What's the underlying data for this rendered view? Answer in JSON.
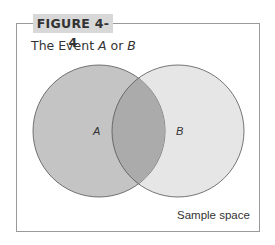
{
  "figure": {
    "label": "FIGURE 4-4",
    "title_prefix": "The Event ",
    "title_a": "A",
    "title_mid": " or ",
    "title_b": "B",
    "sample_space_label": "Sample space"
  },
  "venn": {
    "sets": [
      {
        "name": "A",
        "cx": 99,
        "cy": 131,
        "r": 66,
        "fill": "#c4c4c4"
      },
      {
        "name": "B",
        "cx": 178,
        "cy": 131,
        "r": 66,
        "fill": "#e6e6e6"
      }
    ],
    "intersection_fill": "#ababab",
    "stroke": "#555555"
  }
}
